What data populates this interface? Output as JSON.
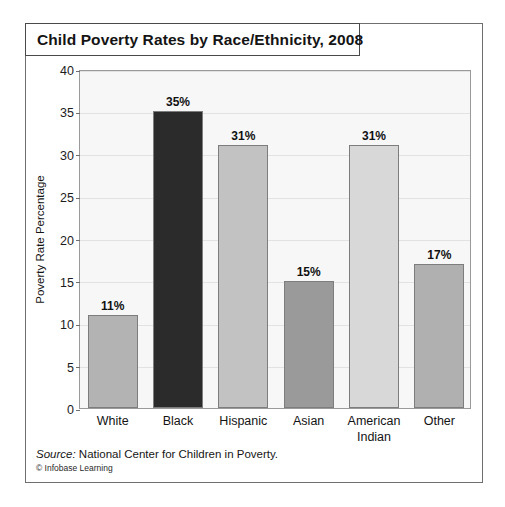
{
  "figure": {
    "title": "Child Poverty Rates by Race/Ethnicity,  2008",
    "source_label": "Source:",
    "source_text": " National Center for Children in Poverty.",
    "copyright": "© Infobase Learning"
  },
  "chart_data": {
    "type": "bar",
    "title": "Child Poverty Rates by Race/Ethnicity,  2008",
    "xlabel": "",
    "ylabel": "Poverty Rate Percentage",
    "ylim": [
      0,
      40
    ],
    "ytick_step": 5,
    "yticks": [
      0,
      5,
      10,
      15,
      20,
      25,
      30,
      35,
      40
    ],
    "ytick_labels": [
      "0",
      "5",
      "10",
      "15",
      "20",
      "25",
      "30",
      "35",
      "40"
    ],
    "grid": true,
    "legend": false,
    "categories": [
      "White",
      "Black",
      "Hispanic",
      "Asian",
      "American Indian",
      "Other"
    ],
    "category_label_lines": [
      [
        "White"
      ],
      [
        "Black"
      ],
      [
        "Hispanic"
      ],
      [
        "Asian"
      ],
      [
        "American",
        "Indian"
      ],
      [
        "Other"
      ]
    ],
    "values": [
      11,
      35,
      31,
      15,
      31,
      17
    ],
    "value_labels": [
      "11%",
      "35%",
      "31%",
      "15%",
      "31%",
      "17%"
    ],
    "bar_colors": [
      "#b3b3b3",
      "#2b2b2b",
      "#c2c2c2",
      "#9a9a9a",
      "#d8d8d8",
      "#b0b0b0"
    ],
    "plot_background": "#f7f7f7",
    "gridline_color": "#e2e2e2",
    "bar_border_color": "#7d7d7d"
  }
}
